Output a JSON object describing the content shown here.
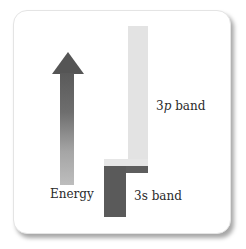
{
  "diagram": {
    "type": "energy-band-diagram",
    "energy_axis": {
      "label": "Energy",
      "icon": "up-arrow-icon",
      "direction": "up"
    },
    "bands": [
      {
        "name": "3p band",
        "prefix": "3",
        "orbital": "p",
        "suffix": " band",
        "color": "#e3e3e3",
        "position": "upper"
      },
      {
        "name": "3s band",
        "prefix": "3",
        "orbital": "s",
        "suffix": " band",
        "color": "#5a5a5a",
        "position": "lower"
      }
    ],
    "overlap": "bands overlap"
  }
}
